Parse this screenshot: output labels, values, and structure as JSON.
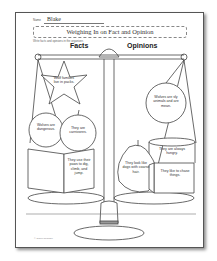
{
  "worksheet": {
    "name_label": "Name",
    "name_value": "Blake",
    "title": "Weighing In on Fact and Opinion",
    "instructions": "Write facts and opinions in the organizer.",
    "headers": {
      "facts": "Facts",
      "opinions": "Opinions"
    },
    "facts": [
      "Wolf families live in packs.",
      "Wolves are dangerous.",
      "They are carnivores.",
      "They use their paws to dig, climb, and jump."
    ],
    "opinions": [
      "Wolves are sly animals and are mean.",
      "They are always hungry.",
      "They look like dogs with coarse hair.",
      "They like to chase things."
    ],
    "copyright": "© Super Teacher"
  },
  "colors": {
    "ink": "#333333",
    "border": "#555555",
    "paper": "#ffffff",
    "accent_gray": "#999999"
  }
}
